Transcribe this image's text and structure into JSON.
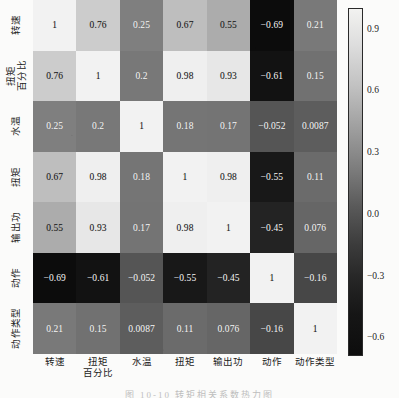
{
  "figure": {
    "caption": "图 10-10  转矩相关系数热力图",
    "background_color": "#fbfbfa"
  },
  "chart_data": {
    "type": "heatmap",
    "title": "",
    "xlabel": "",
    "ylabel": "",
    "colormap": "grayscale-reversed",
    "grid": false,
    "legend_position": "right",
    "annotations": "every cell labeled with its correlation value",
    "categories": [
      "转速",
      "扭矩百分比",
      "水温",
      "扭矩",
      "输出功",
      "动作",
      "动作类型"
    ],
    "x_tick_labels": [
      "转速",
      "扭矩百分比",
      "水温",
      "扭矩",
      "输出功",
      "动作",
      "动作类型"
    ],
    "y_tick_labels": [
      "转速",
      "扭矩百分比",
      "水温",
      "扭矩",
      "输出功",
      "动作",
      "动作类型"
    ],
    "x_tick_labels_lines": [
      [
        "转速"
      ],
      [
        "扭矩",
        "百分比"
      ],
      [
        "水温"
      ],
      [
        "扭矩"
      ],
      [
        "输出功"
      ],
      [
        "动作"
      ],
      [
        "动作类型"
      ]
    ],
    "y_tick_labels_lines": [
      [
        "转速"
      ],
      [
        "扭矩",
        "百分比"
      ],
      [
        "水温"
      ],
      [
        "扭矩"
      ],
      [
        "输出功"
      ],
      [
        "动作"
      ],
      [
        "动作类型"
      ]
    ],
    "values": [
      [
        1,
        0.76,
        0.25,
        0.67,
        0.55,
        -0.69,
        0.21
      ],
      [
        0.76,
        1,
        0.2,
        0.98,
        0.93,
        -0.61,
        0.15
      ],
      [
        0.25,
        0.2,
        1,
        0.18,
        0.17,
        -0.052,
        0.0087
      ],
      [
        0.67,
        0.98,
        0.18,
        1,
        0.98,
        -0.55,
        0.11
      ],
      [
        0.55,
        0.93,
        0.17,
        0.98,
        1,
        -0.45,
        0.076
      ],
      [
        -0.69,
        -0.61,
        -0.052,
        -0.55,
        -0.45,
        1,
        -0.16
      ],
      [
        0.21,
        0.15,
        0.0087,
        0.11,
        0.076,
        -0.16,
        1
      ]
    ],
    "cell_labels": [
      [
        "1",
        "0.76",
        "0.25",
        "0.67",
        "0.55",
        "−0.69",
        "0.21"
      ],
      [
        "0.76",
        "1",
        "0.2",
        "0.98",
        "0.93",
        "−0.61",
        "0.15"
      ],
      [
        "0.25",
        "0.2",
        "1",
        "0.18",
        "0.17",
        "−0.052",
        "0.0087"
      ],
      [
        "0.67",
        "0.98",
        "0.18",
        "1",
        "0.98",
        "−0.55",
        "0.11"
      ],
      [
        "0.55",
        "0.93",
        "0.17",
        "0.98",
        "1",
        "−0.45",
        "0.076"
      ],
      [
        "−0.69",
        "−0.61",
        "−0.052",
        "−0.55",
        "−0.45",
        "1",
        "−0.16"
      ],
      [
        "0.21",
        "0.15",
        "0.0087",
        "0.11",
        "0.076",
        "−0.16",
        "1"
      ]
    ],
    "colorbar": {
      "ticks": [
        "0.9",
        "0.6",
        "0.3",
        "0.0",
        "−0.3",
        "−0.6"
      ],
      "tick_values": [
        0.9,
        0.6,
        0.3,
        0.0,
        -0.3,
        -0.6
      ],
      "vmin": -0.69,
      "vmax": 1.0,
      "orientation": "vertical",
      "high_color": "#f2f2f0",
      "low_color": "#0d0d0d"
    }
  }
}
